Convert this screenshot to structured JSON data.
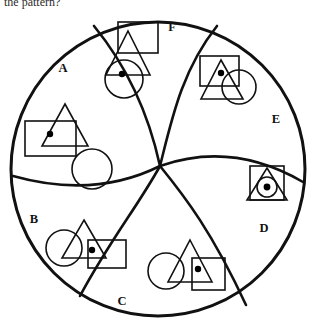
{
  "figure": {
    "prompt": "the pattern?",
    "type": "non-verbal-reasoning-pinwheel-diagram",
    "outer_shape": "circle",
    "segment_count": 6,
    "segments": [
      {
        "id": "A",
        "label": "A",
        "label_x": 63,
        "label_y": 72,
        "position": "upper-left",
        "shapes": [
          "triangle",
          "rectangle",
          "dot",
          "circle-empty"
        ],
        "dot_count": 1,
        "description": "triangle overlapping a rectangle with one dot, plus a separate empty circle"
      },
      {
        "id": "F",
        "label": "F",
        "label_x": 172,
        "label_y": 31,
        "position": "top",
        "shapes": [
          "rectangle",
          "triangle",
          "circle",
          "dot"
        ],
        "dot_count": 1,
        "description": "rectangle above a triangle overlapping a circle with one dot"
      },
      {
        "id": "E",
        "label": "E",
        "label_x": 276,
        "label_y": 123,
        "position": "right",
        "shapes": [
          "rectangle",
          "triangle",
          "circle",
          "dot"
        ],
        "dot_count": 1,
        "description": "square, triangle with one dot, and a circle overlapping on the right"
      },
      {
        "id": "D",
        "label": "D",
        "label_x": 264,
        "label_y": 232,
        "position": "lower-right",
        "shapes": [
          "rectangle",
          "triangle",
          "circle",
          "dot"
        ],
        "dot_count": 1,
        "description": "small square containing a triangle containing a circle with one dot"
      },
      {
        "id": "C",
        "label": "C",
        "label_x": 122,
        "label_y": 305,
        "position": "bottom",
        "shapes": [
          "circle",
          "triangle",
          "rectangle",
          "dot"
        ],
        "dot_count": 1,
        "description": "circle, triangle and rectangle overlapping with one dot in the rectangle"
      },
      {
        "id": "B",
        "label": "B",
        "label_x": 34,
        "label_y": 223,
        "position": "lower-left",
        "shapes": [
          "circle",
          "triangle",
          "rectangle",
          "dot"
        ],
        "dot_count": 1,
        "description": "circle, triangle and rectangle overlapping with one dot"
      }
    ],
    "colors": {
      "stroke": "#111111",
      "background": "#ffffff",
      "dot_fill": "#000000"
    },
    "center_point": {
      "x": 160,
      "y": 166
    },
    "outer_circle": {
      "cx": 158,
      "cy": 169,
      "r": 148
    }
  }
}
